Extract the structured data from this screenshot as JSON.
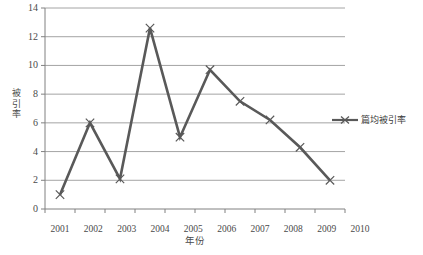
{
  "chart_data": {
    "type": "line",
    "title": "",
    "xlabel": "年份",
    "ylabel": "被引率",
    "categories": [
      "2001",
      "2002",
      "2003",
      "2004",
      "2005",
      "2006",
      "2007",
      "2008",
      "2009",
      "2010"
    ],
    "series": [
      {
        "name": "篇均被引率",
        "values": [
          1.0,
          6.0,
          2.1,
          12.6,
          5.0,
          9.7,
          7.5,
          6.2,
          4.3,
          2.0
        ],
        "color": "#595959",
        "marker": "x"
      }
    ],
    "ylim": [
      0,
      14
    ],
    "yticks": [
      0,
      2,
      4,
      6,
      8,
      10,
      12,
      14
    ],
    "ytick_labels": [
      "0",
      "2",
      "4",
      "6",
      "8",
      "10",
      "12",
      "14"
    ],
    "grid": true,
    "grid_axis": "y",
    "grid_color": "#9a9a9a",
    "legend_position": "right",
    "legend_entries": [
      "篇均被引率"
    ],
    "axis_color": "#808080",
    "background": "#ffffff"
  }
}
